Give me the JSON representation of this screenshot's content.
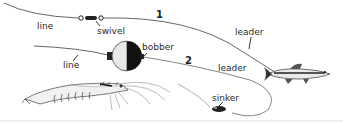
{
  "diagram": {
    "type": "fishing-rig-illustration",
    "rigs": [
      {
        "number": "1",
        "labels": {
          "line": "line",
          "swivel": "swivel",
          "leader": "leader"
        }
      },
      {
        "number": "2",
        "labels": {
          "line": "line",
          "bobber": "bobber",
          "leader": "leader",
          "sinker": "sinker"
        }
      }
    ],
    "baits": [
      "shrimp",
      "minnow"
    ],
    "colors": {
      "line": "#555555",
      "ink": "#222222",
      "background": "#ffffff",
      "ground": "#d8d8d8"
    }
  }
}
